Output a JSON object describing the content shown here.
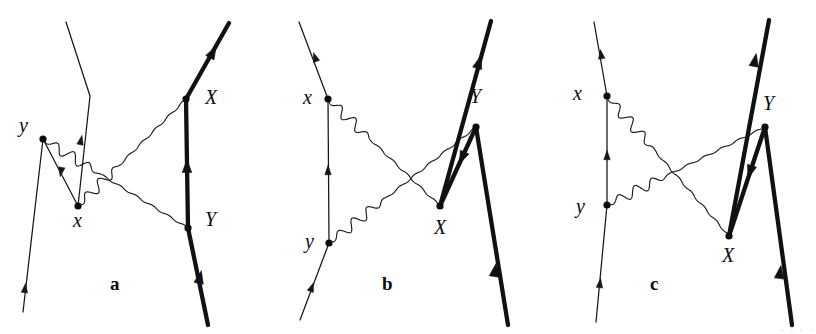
{
  "figure": {
    "kind": "feynman-diagram-set",
    "background_color": "#ffffff",
    "ink_color": "#0b0c0e",
    "width": 816,
    "height": 334,
    "edge_artifact_text": "· · · ·"
  },
  "panels": [
    {
      "id": "a",
      "label": "a",
      "label_x": 110,
      "label_y": 290,
      "vertex_labels": [
        {
          "name": "y",
          "text": "y",
          "x": 19,
          "y": 132,
          "dot_x": 43,
          "dot_y": 139
        },
        {
          "name": "x",
          "text": "x",
          "x": 73,
          "y": 227,
          "dot_x": 78,
          "dot_y": 206
        },
        {
          "name": "X",
          "text": "X",
          "x": 205,
          "y": 104,
          "dot_x": 186,
          "dot_y": 99
        },
        {
          "name": "Y",
          "text": "Y",
          "x": 205,
          "y": 226,
          "dot_x": 188,
          "dot_y": 228
        }
      ],
      "thin_fermion_path": "M 23,312 L 43,139 L 78,206 L 90,96 L 66,22",
      "thin_arrows": [
        {
          "x": 25,
          "y": 288,
          "angle": -83
        },
        {
          "x": 61,
          "y": 172,
          "angle": 100
        },
        {
          "x": 81,
          "y": 140,
          "angle": -78
        }
      ],
      "thick_fermion_path": "M 208,325 L 188,228 L 186,99 L 229,23",
      "thick_arrows": [
        {
          "x": 200,
          "y": 277,
          "angle": -78
        },
        {
          "x": 187,
          "y": 166,
          "angle": -90
        },
        {
          "x": 213,
          "y": 52,
          "angle": -61
        }
      ],
      "photons": [
        {
          "name": "photon-y-to-Y",
          "from": "y",
          "to": "Y",
          "x1": 43,
          "y1": 139,
          "x2": 188,
          "y2": 228,
          "amplitude": 5.2,
          "wavelength": 19
        },
        {
          "name": "photon-x-to-X",
          "from": "x",
          "to": "X",
          "x1": 78,
          "y1": 206,
          "x2": 186,
          "y2": 99,
          "amplitude": 5.2,
          "wavelength": 19
        }
      ]
    },
    {
      "id": "b",
      "label": "b",
      "label_x": 382,
      "label_y": 290,
      "vertex_labels": [
        {
          "name": "x",
          "text": "x",
          "x": 303,
          "y": 104,
          "dot_x": 328,
          "dot_y": 99
        },
        {
          "name": "y",
          "text": "y",
          "x": 305,
          "y": 248,
          "dot_x": 329,
          "dot_y": 243
        },
        {
          "name": "X",
          "text": "X",
          "x": 434,
          "y": 234,
          "dot_x": 440,
          "dot_y": 206
        },
        {
          "name": "Y",
          "text": "Y",
          "x": 470,
          "y": 103,
          "dot_x": 476,
          "dot_y": 127
        }
      ],
      "thin_fermion_path": "M 300,320 L 329,243 L 328,99 L 299,22",
      "thin_arrows": [
        {
          "x": 312,
          "y": 287,
          "angle": -69
        },
        {
          "x": 328,
          "y": 170,
          "angle": -90
        },
        {
          "x": 315,
          "y": 57,
          "angle": -110
        }
      ],
      "thick_fermion_path": "M 440,206 L 491,21",
      "thick_arrows": [
        {
          "x": 479,
          "y": 62,
          "angle": -74
        }
      ],
      "thick_fermion_path2": "M 476,127 L 440,206",
      "thick_arrows2": [
        {
          "x": 462,
          "y": 158,
          "angle": 114
        }
      ],
      "thick_fermion_path3": "M 476,127 L 508,325",
      "thick_arrows3": [
        {
          "x": 495,
          "y": 270,
          "angle": -81
        }
      ],
      "photons": [
        {
          "name": "photon-x-to-X",
          "from": "x",
          "to": "X",
          "x1": 328,
          "y1": 99,
          "x2": 440,
          "y2": 206,
          "amplitude": 5.2,
          "wavelength": 19
        },
        {
          "name": "photon-y-to-Y",
          "from": "y",
          "to": "Y",
          "x1": 329,
          "y1": 243,
          "x2": 476,
          "y2": 127,
          "amplitude": 5.2,
          "wavelength": 19
        }
      ]
    },
    {
      "id": "c",
      "label": "c",
      "label_x": 650,
      "label_y": 290,
      "vertex_labels": [
        {
          "name": "x",
          "text": "x",
          "x": 573,
          "y": 100,
          "dot_x": 607,
          "dot_y": 96
        },
        {
          "name": "y",
          "text": "y",
          "x": 576,
          "y": 213,
          "dot_x": 607,
          "dot_y": 205
        },
        {
          "name": "X",
          "text": "X",
          "x": 722,
          "y": 262,
          "dot_x": 729,
          "dot_y": 236
        },
        {
          "name": "Y",
          "text": "Y",
          "x": 763,
          "y": 110,
          "dot_x": 765,
          "dot_y": 127
        },
        {
          "name": "X-dot-extra",
          "text": "",
          "x": 0,
          "y": 0,
          "dot_x": 0,
          "dot_y": 0
        }
      ],
      "thin_fermion_path": "M 596,322 L 607,205 L 607,96 L 594,22",
      "thin_arrows": [
        {
          "x": 600,
          "y": 283,
          "angle": -83
        },
        {
          "x": 607,
          "y": 155,
          "angle": -90
        },
        {
          "x": 601,
          "y": 54,
          "angle": -99
        }
      ],
      "thick_fermion_path": "M 729,236 L 769,20",
      "thick_arrows": [
        {
          "x": 755,
          "y": 60,
          "angle": -79
        }
      ],
      "thick_fermion_path2": "M 765,127 L 729,236",
      "thick_arrows2": [
        {
          "x": 750,
          "y": 172,
          "angle": 108
        }
      ],
      "thick_fermion_path3": "M 765,127 L 792,325",
      "thick_arrows3": [
        {
          "x": 780,
          "y": 272,
          "angle": -82
        }
      ],
      "photons": [
        {
          "name": "photon-x-to-X",
          "from": "x",
          "to": "X",
          "x1": 607,
          "y1": 96,
          "x2": 729,
          "y2": 236,
          "amplitude": 5.2,
          "wavelength": 19
        },
        {
          "name": "photon-y-to-Y",
          "from": "y",
          "to": "Y",
          "x1": 607,
          "y1": 205,
          "x2": 765,
          "y2": 127,
          "amplitude": 5.2,
          "wavelength": 19
        }
      ]
    }
  ]
}
